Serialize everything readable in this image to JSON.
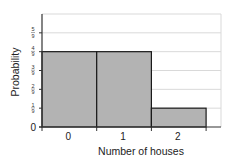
{
  "chart_data": {
    "type": "bar",
    "title": "",
    "xlabel": "Number of houses",
    "ylabel": "Probability",
    "categories": [
      "0",
      "1",
      "2"
    ],
    "values": [
      0.4444,
      0.4444,
      0.1111
    ],
    "values_fraction": [
      "4/9",
      "4/9",
      "1/9"
    ],
    "ylim": [
      0,
      0.6667
    ],
    "yticks": [
      {
        "label": "0",
        "value": 0
      },
      {
        "label": "1/9",
        "num": "1",
        "den": "9",
        "value": 0.1111
      },
      {
        "label": "2/9",
        "num": "2",
        "den": "9",
        "value": 0.2222
      },
      {
        "label": "3/9",
        "num": "3",
        "den": "9",
        "value": 0.3333
      },
      {
        "label": "4/9",
        "num": "4",
        "den": "9",
        "value": 0.4444
      },
      {
        "label": "5/9",
        "num": "5",
        "den": "9",
        "value": 0.5556
      }
    ],
    "grid": true,
    "legend": null,
    "bar_style": "histogram (adjacent bars, no gaps)",
    "colors": {
      "bar_fill": "#b3b3b3",
      "bar_edge": "#1a1a1a",
      "grid": "#d9d9d9",
      "axis": "#333333"
    }
  }
}
